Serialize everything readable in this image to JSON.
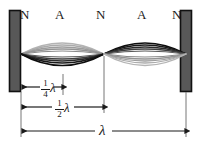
{
  "diagram": {
    "colors": {
      "wall_fill": "#585858",
      "wall_stroke": "#111111",
      "wave_dark": "#111111",
      "wave_mid": "#555555",
      "wave_light": "#aaaaaa",
      "wave_faint": "#c8c8c8",
      "annotation": "#1b1b1b",
      "background": "#ffffff"
    },
    "point_labels": [
      {
        "text": "N",
        "kind": "node",
        "x": 24,
        "y": 9
      },
      {
        "text": "A",
        "kind": "antinode",
        "x": 59,
        "y": 9
      },
      {
        "text": "N",
        "kind": "node",
        "x": 100,
        "y": 9
      },
      {
        "text": "A",
        "kind": "antinode",
        "x": 141,
        "y": 9
      },
      {
        "text": "N",
        "kind": "node",
        "x": 176,
        "y": 9
      }
    ],
    "walls": [
      {
        "name": "left-wall",
        "x": 9,
        "y": 10,
        "w": 12,
        "h": 82
      },
      {
        "name": "right-wall",
        "x": 180,
        "y": 10,
        "w": 12,
        "h": 82
      }
    ],
    "measurements": [
      {
        "id": "quarter-lambda",
        "numerator": "1",
        "denominator": "4",
        "symbol": "λ",
        "label": "1/4 λ",
        "from_x": 21,
        "to_x": 63,
        "y": 87
      },
      {
        "id": "half-lambda",
        "numerator": "1",
        "denominator": "2",
        "symbol": "λ",
        "label": "1/2 λ",
        "from_x": 21,
        "to_x": 104,
        "y": 107
      },
      {
        "id": "full-lambda",
        "numerator": "",
        "denominator": "",
        "symbol": "λ",
        "label": "λ",
        "from_x": 21,
        "to_x": 186,
        "y": 131
      }
    ],
    "wave": {
      "axis_y": 54,
      "node_positions_x": [
        21,
        104,
        186
      ],
      "antinode_positions_x": [
        62,
        145
      ],
      "amplitudes": [
        22,
        18,
        14,
        10,
        6,
        3
      ],
      "left_lobe_dark_side": "below",
      "right_lobe_dark_side": "above"
    }
  }
}
